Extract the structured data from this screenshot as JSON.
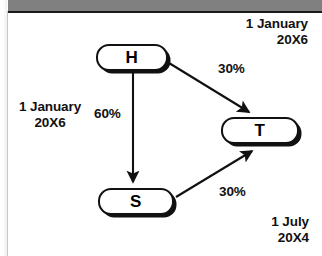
{
  "header": {
    "title": ""
  },
  "diagram": {
    "nodes": [
      {
        "id": "h",
        "label": "H"
      },
      {
        "id": "t",
        "label": "T"
      },
      {
        "id": "s",
        "label": "S"
      }
    ],
    "edges": [
      {
        "from": "H",
        "to": "T",
        "label": "30%"
      },
      {
        "from": "H",
        "to": "S",
        "label": "60%"
      },
      {
        "from": "S",
        "to": "T",
        "label": "30%"
      }
    ],
    "annotations": {
      "top_right_date": "1 January\n20X6",
      "left_date": "1 January\n20X6",
      "bottom_right_date": "1 July\n20X4"
    },
    "colors": {
      "node_border": "#111111",
      "node_fill": "#ffffff",
      "arrow": "#111111",
      "header_bar": "#808080",
      "page": "#ffffff"
    }
  }
}
